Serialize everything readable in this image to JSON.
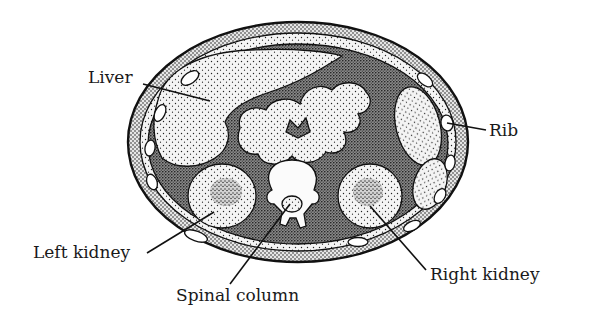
{
  "diagram": {
    "style": "black-and-white stippled line drawing",
    "labels": {
      "liver": "Liver",
      "rib": "Rib",
      "left_kidney": "Left kidney",
      "spinal_column": "Spinal column",
      "right_kidney": "Right kidney"
    },
    "colors": {
      "ink": "#111111",
      "background": "#ffffff",
      "organ_fill": "#f2f2f2",
      "dense_tissue": "#5a5a5a",
      "wall_fill": "#9a9a9a"
    }
  }
}
